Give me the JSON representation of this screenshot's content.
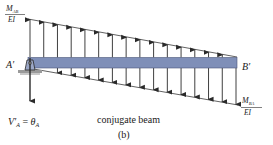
{
  "diagram": {
    "label_left_top": {
      "num": "M",
      "num_sub": "AB",
      "den": "EI"
    },
    "label_right_bottom": {
      "num": "M",
      "num_sub": "BA",
      "den": "EI"
    },
    "support_label": "A′",
    "end_label": "B′",
    "reaction_label": {
      "lhs": "V′",
      "lhs_sub": "A",
      "eq": " = ",
      "rhs": "θ",
      "rhs_sub": "A"
    },
    "caption": "conjugate beam",
    "sublabel": "(b)",
    "beam_color": "#7f8fb8",
    "arrow_color": "#2a2a2a",
    "icons": [
      "pin-support-icon",
      "reaction-arrow-icon"
    ],
    "up_arrow_count": 16,
    "down_arrow_count": 16
  }
}
